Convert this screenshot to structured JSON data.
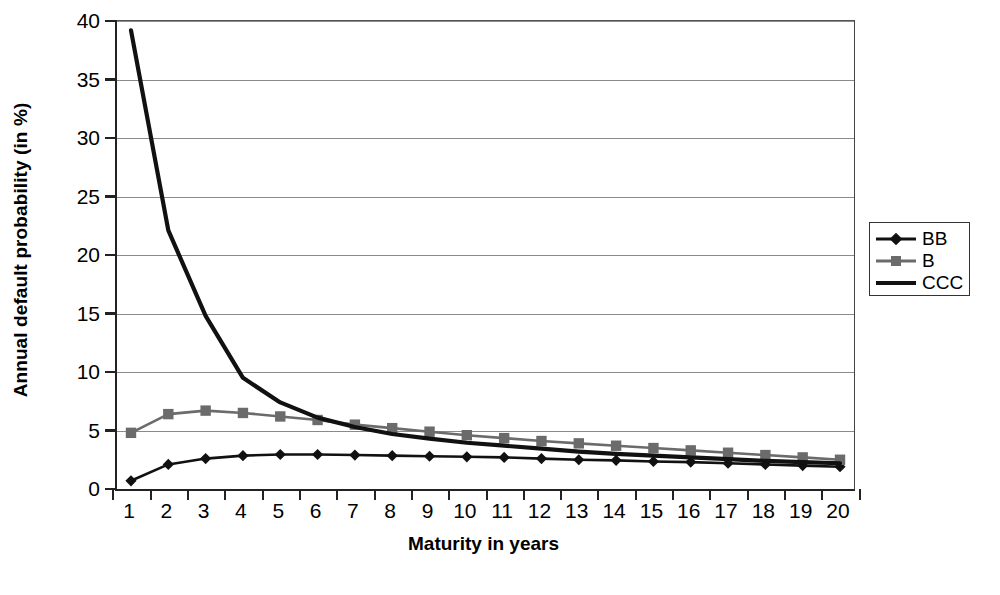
{
  "chart_data": {
    "type": "line",
    "title": "",
    "xlabel": "Maturity in years",
    "ylabel": "Annual default probability (in %)",
    "xlim": [
      1,
      20
    ],
    "ylim": [
      0,
      40
    ],
    "ytick_values": [
      0,
      5,
      10,
      15,
      20,
      25,
      30,
      35,
      40
    ],
    "ytick_labels": [
      "0",
      "5",
      "10",
      "15",
      "20",
      "25",
      "30",
      "35",
      "40"
    ],
    "xtick_labels": [
      "1",
      "2",
      "3",
      "4",
      "5",
      "6",
      "7",
      "8",
      "9",
      "10",
      "11",
      "12",
      "13",
      "14",
      "15",
      "16",
      "17",
      "18",
      "19",
      "20"
    ],
    "x": [
      1,
      2,
      3,
      4,
      5,
      6,
      7,
      8,
      9,
      10,
      11,
      12,
      13,
      14,
      15,
      16,
      17,
      18,
      19,
      20
    ],
    "grid": "horizontal",
    "legend_position": "right",
    "series": [
      {
        "name": "BB",
        "color": "#111111",
        "marker": "diamond",
        "marker_color": "#111111",
        "values": [
          0.7,
          2.1,
          2.6,
          2.85,
          2.95,
          2.95,
          2.9,
          2.85,
          2.8,
          2.75,
          2.7,
          2.6,
          2.5,
          2.45,
          2.35,
          2.3,
          2.2,
          2.1,
          2.0,
          1.9
        ]
      },
      {
        "name": "B",
        "color": "#6b6b6b",
        "marker": "square",
        "marker_color": "#6b6b6b",
        "values": [
          4.8,
          6.4,
          6.7,
          6.5,
          6.2,
          5.9,
          5.5,
          5.2,
          4.9,
          4.6,
          4.35,
          4.1,
          3.9,
          3.7,
          3.5,
          3.3,
          3.1,
          2.9,
          2.7,
          2.5
        ]
      },
      {
        "name": "CCC",
        "color": "#111111",
        "marker": "none",
        "marker_color": "#111111",
        "values": [
          39.2,
          22.1,
          14.8,
          9.5,
          7.4,
          6.1,
          5.3,
          4.7,
          4.3,
          3.95,
          3.7,
          3.45,
          3.2,
          3.0,
          2.85,
          2.7,
          2.55,
          2.4,
          2.3,
          2.2
        ]
      }
    ]
  },
  "legend": {
    "entries": [
      {
        "label": "BB"
      },
      {
        "label": "B"
      },
      {
        "label": "CCC"
      }
    ]
  }
}
